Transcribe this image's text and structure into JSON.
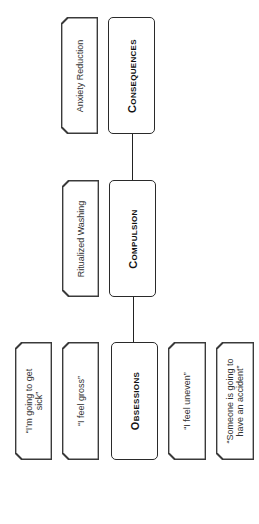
{
  "diagram": {
    "type": "hierarchy",
    "orientation": "rotated-90-ccw",
    "main_nodes": [
      {
        "id": "consequences",
        "label": "Consequences",
        "example": "Anxiety Reduction"
      },
      {
        "id": "compulsion",
        "label": "Compulsion",
        "example": "Ritualized Washing"
      },
      {
        "id": "obsessions",
        "label": "Obsessions",
        "examples": [
          "“I’m going to get\nsick”",
          "“I feel gross”",
          "“I feel uneven”",
          "“Someone is going to\nhave an accident”"
        ]
      }
    ],
    "edges": [
      {
        "from": "obsessions",
        "to": "compulsion"
      },
      {
        "from": "compulsion",
        "to": "consequences"
      }
    ]
  }
}
